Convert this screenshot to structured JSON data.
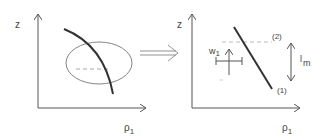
{
  "left_panel": {
    "y_axis_label": "z",
    "x_axis_label": "ρ",
    "x_axis_subscript": "1"
  },
  "right_panel": {
    "y_axis_label": "z",
    "x_axis_label": "ρ",
    "x_axis_subscript": "1",
    "width_label": "w",
    "width_subscript": "1",
    "length_label": "l",
    "length_subscript": "m",
    "point_top": "(2)",
    "point_bottom": "(1)"
  },
  "colors": {
    "stroke": "#333333",
    "thin": "#555555",
    "dashed": "#aaaaaa"
  }
}
